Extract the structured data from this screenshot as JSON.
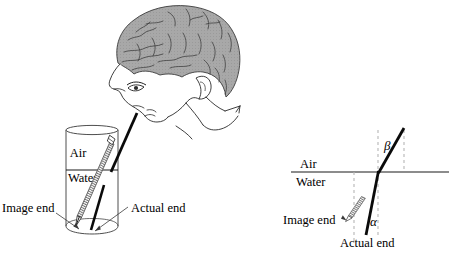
{
  "figure": {
    "title_text": "",
    "domain": "physics-refraction-illustration",
    "background_color": "#ffffff",
    "ink_color": "#000000",
    "hair_fill_color": "#a8a8a8",
    "hair_line_color": "#3a3a3a",
    "interface_line_color": "#8c8c8c",
    "dashed_line_color": "#b4b4b4",
    "pencil_hatch_color": "#6e6e6e"
  },
  "left_panel": {
    "name": "observer-and-glass-scene",
    "glass": {
      "name": "water-glass",
      "medium_labels": [
        {
          "key": "air",
          "text": "Air"
        },
        {
          "key": "water",
          "text": "Water"
        }
      ]
    },
    "observer": {
      "name": "person-head-looking-down",
      "parts": [
        "hair",
        "face-profile",
        "eye",
        "ear",
        "neck",
        "shoulder"
      ]
    },
    "annotations": [
      {
        "key": "image_end",
        "text": "Image end"
      },
      {
        "key": "actual_end",
        "text": "Actual end"
      }
    ],
    "pencil": {
      "name": "pencil-in-water",
      "apparent_segment": "image-end-ray",
      "real_segment": "actual-end-ray"
    }
  },
  "right_panel": {
    "name": "ray-geometry-diagram",
    "medium_labels": [
      {
        "key": "air",
        "text": "Air"
      },
      {
        "key": "water",
        "text": "Water"
      }
    ],
    "angles": [
      {
        "key": "beta",
        "symbol": "β",
        "position": "above-interface"
      },
      {
        "key": "alpha",
        "symbol": "α",
        "position": "below-interface"
      }
    ],
    "annotations": [
      {
        "key": "image_end",
        "text": "Image end"
      },
      {
        "key": "actual_end",
        "text": "Actual end"
      }
    ],
    "elements": [
      "horizontal-interface-line",
      "dashed-normal-left",
      "dashed-normal-center",
      "dashed-normal-right",
      "refracted-ray",
      "image-end-pencil-tip"
    ]
  }
}
